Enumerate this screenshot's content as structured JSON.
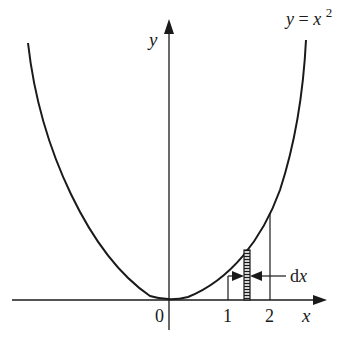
{
  "diagram": {
    "curve_label": "y = x",
    "curve_label_parts": {
      "lhs": "y",
      "eq": "=",
      "base": "x",
      "exp": "2"
    },
    "y_axis_label": "y",
    "x_axis_label": "x",
    "origin_label": "0",
    "tick_labels": [
      "1",
      "2"
    ],
    "strip_label": "dx",
    "colors": {
      "ink": "#1a1a1a",
      "background": "#ffffff"
    }
  }
}
